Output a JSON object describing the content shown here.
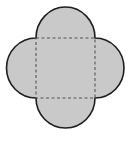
{
  "diagram": {
    "shape": "square-with-four-semicircles",
    "colors": {
      "fill": "#c9c9c9",
      "outline": "#1e1e1e",
      "dashed_square": "#555555",
      "background": "#ffffff"
    },
    "semicircles": [
      "top",
      "right",
      "bottom",
      "left"
    ]
  }
}
